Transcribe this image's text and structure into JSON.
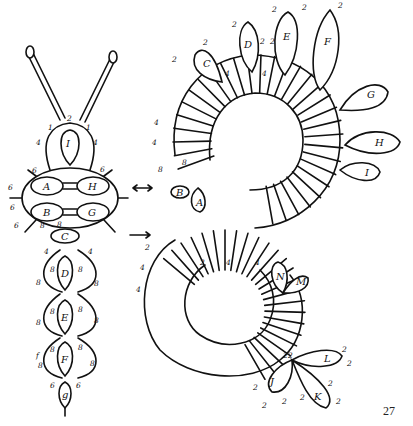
{
  "figure": {
    "page_number": "27",
    "arrow_symbols": [
      "double-arrow",
      "right-arrow"
    ],
    "left_figure": {
      "head_ring": {
        "label": "I",
        "counts": [
          "2",
          "1",
          "1",
          "4",
          "4",
          "4",
          "4"
        ]
      },
      "wings": [
        {
          "label": "A",
          "counts": [
            "6",
            "6"
          ]
        },
        {
          "label": "H",
          "counts": [
            "6"
          ]
        },
        {
          "label": "B",
          "counts": [
            "6"
          ]
        },
        {
          "label": "G",
          "counts": []
        }
      ],
      "thorax_ring": {
        "label": "C",
        "counts": [
          "8",
          "4",
          "4"
        ]
      },
      "segments": [
        {
          "label": "D",
          "counts": [
            "8",
            "8",
            "8"
          ]
        },
        {
          "label": "E",
          "counts": [
            "8",
            "8",
            "8"
          ]
        },
        {
          "label": "F",
          "counts": [
            "8",
            "8",
            "8",
            "8"
          ]
        },
        {
          "label": "g",
          "counts": [
            "6",
            "6"
          ]
        }
      ]
    },
    "right_figure": {
      "top_rings": [
        {
          "label": "C",
          "counts": [
            "2",
            "2",
            "4",
            "2"
          ]
        },
        {
          "label": "D",
          "counts": [
            "2",
            "2",
            "2",
            "4"
          ]
        },
        {
          "label": "E",
          "counts": [
            "2",
            "2",
            "2",
            "4"
          ]
        },
        {
          "label": "F",
          "counts": [
            "2",
            "2",
            "2",
            "2",
            "4"
          ]
        },
        {
          "label": "G",
          "counts": []
        },
        {
          "label": "H",
          "counts": []
        },
        {
          "label": "I",
          "counts": []
        }
      ],
      "inner_rings": [
        {
          "label": "A",
          "counts": [
            "8",
            "4"
          ]
        },
        {
          "label": "B",
          "counts": [
            "8",
            "4"
          ]
        },
        {
          "label": "N",
          "counts": [
            "4",
            "8"
          ]
        },
        {
          "label": "M",
          "counts": [
            "4",
            "8",
            "4"
          ]
        }
      ],
      "bottom_rings": [
        {
          "label": "J",
          "counts": [
            "2",
            "2",
            "2",
            "4",
            "4"
          ]
        },
        {
          "label": "K",
          "counts": [
            "2",
            "2",
            "2",
            "2",
            "4"
          ]
        },
        {
          "label": "L",
          "counts": [
            "2",
            "2",
            "4"
          ]
        }
      ],
      "spiral_counts": [
        "4",
        "4",
        "4",
        "4",
        "2",
        "2",
        "2",
        "8",
        "8",
        "4"
      ]
    }
  }
}
